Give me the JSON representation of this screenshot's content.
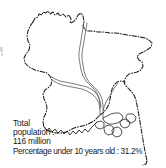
{
  "figure": {
    "background_color": "#ffffff",
    "ink_color": "#1a1a1a"
  },
  "map": {
    "country": "Bangladesh",
    "border_style": "dash-dot",
    "river_style": "solid-thin",
    "rivers": [
      "Jamuna",
      "Padma",
      "Meghna"
    ],
    "features": [
      "national-border",
      "river-network",
      "delta-islands"
    ]
  },
  "caption": {
    "lines": [
      "Total",
      "population :",
      "116 million",
      "Percentage under 10 years old : 31.2%"
    ],
    "line1": "Total",
    "line2": "population :",
    "line3": "116 million",
    "line4": "Percentage under 10 years old : 31.2%"
  },
  "stats": {
    "total_population_label": "Total population :",
    "total_population_value": "116 million",
    "under_ten_label": "Percentage under 10 years old :",
    "under_ten_value": "31.2%"
  }
}
